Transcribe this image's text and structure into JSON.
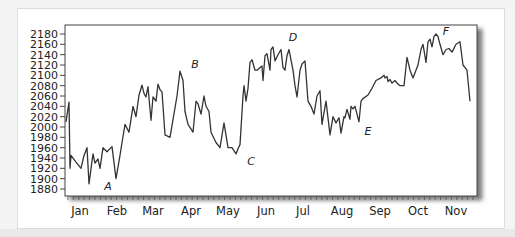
{
  "chart_data": {
    "type": "line",
    "title": "",
    "xlabel": "",
    "ylabel": "",
    "ylim": [
      1880,
      2180
    ],
    "grid": false,
    "legend": null,
    "y_ticks": [
      1880,
      1900,
      1920,
      1940,
      1960,
      1980,
      2000,
      2020,
      2040,
      2060,
      2080,
      2100,
      2120,
      2140,
      2160,
      2180
    ],
    "x_ticks": [
      "Jan",
      "Feb",
      "Mar",
      "Apr",
      "May",
      "Jun",
      "Jul",
      "Aug",
      "Sep",
      "Oct",
      "Nov"
    ],
    "annotations": [
      {
        "label": "A",
        "near_month": "Feb",
        "value": 1895,
        "position": "below trough"
      },
      {
        "label": "B",
        "near_month": "Apr",
        "value": 2110,
        "position": "above peak"
      },
      {
        "label": "C",
        "near_month": "May/Jun",
        "value": 1950,
        "position": "below trough"
      },
      {
        "label": "D",
        "near_month": "Jun/Jul",
        "value": 2155,
        "position": "above peak"
      },
      {
        "label": "E",
        "near_month": "Aug/Sep",
        "value": 2005,
        "position": "below trough"
      },
      {
        "label": "F",
        "near_month": "Oct/Nov",
        "value": 2180,
        "position": "above peak"
      }
    ],
    "series": [
      {
        "name": "Index",
        "x_px": [
          66,
          69,
          70,
          71,
          76,
          81,
          84,
          87,
          89,
          93,
          95,
          98,
          100,
          103,
          107,
          112,
          116,
          120,
          122,
          125,
          129,
          133,
          136,
          139,
          142,
          144,
          146,
          148,
          151,
          153,
          156,
          158,
          160,
          162,
          165,
          170,
          177,
          180,
          183,
          185,
          188,
          193,
          196,
          198,
          201,
          204,
          206,
          209,
          211,
          216,
          220,
          224,
          228,
          232,
          236,
          238,
          240,
          243,
          244,
          246,
          248,
          250,
          252,
          255,
          257,
          262,
          263,
          265,
          267,
          270,
          271,
          273,
          275,
          278,
          281,
          283,
          285,
          287,
          289,
          291,
          293,
          295,
          297,
          300,
          302,
          305,
          308,
          311,
          314,
          317,
          320,
          322,
          326,
          330,
          333,
          336,
          339,
          341,
          344,
          345,
          347,
          350,
          351,
          353,
          355,
          357,
          359,
          361,
          363,
          368,
          372,
          376,
          381,
          384,
          385,
          387,
          388,
          390,
          392,
          395,
          397,
          400,
          404,
          407,
          410,
          413,
          415,
          418,
          421,
          423,
          426,
          428,
          430,
          432,
          434,
          436,
          438,
          440,
          443,
          446,
          449,
          452,
          456,
          460,
          463,
          467,
          470,
          474
        ],
        "values": [
          2010,
          2048,
          1920,
          1945,
          1932,
          1920,
          1945,
          1960,
          1890,
          1948,
          1930,
          1938,
          1920,
          1960,
          1952,
          1962,
          1900,
          1945,
          1970,
          2005,
          1990,
          2040,
          2020,
          2062,
          2081,
          2065,
          2058,
          2078,
          2013,
          2058,
          2050,
          2083,
          2072,
          2068,
          1985,
          1980,
          2060,
          2108,
          2090,
          2030,
          2005,
          1990,
          2050,
          2045,
          2025,
          2060,
          2040,
          2030,
          1990,
          1970,
          1960,
          2008,
          1960,
          1960,
          1948,
          1958,
          1966,
          2060,
          2080,
          2050,
          2075,
          2125,
          2130,
          2110,
          2110,
          2118,
          2090,
          2138,
          2142,
          2110,
          2150,
          2155,
          2128,
          2140,
          2150,
          2115,
          2110,
          2138,
          2150,
          2130,
          2110,
          2080,
          2058,
          2110,
          2122,
          2128,
          2050,
          2040,
          2025,
          2060,
          2070,
          2005,
          2050,
          1985,
          2020,
          2008,
          2018,
          1988,
          2020,
          2018,
          2034,
          2015,
          2040,
          2035,
          2040,
          2025,
          2010,
          2050,
          2055,
          2062,
          2075,
          2090,
          2095,
          2100,
          2095,
          2098,
          2088,
          2092,
          2085,
          2090,
          2085,
          2080,
          2080,
          2135,
          2110,
          2095,
          2105,
          2120,
          2150,
          2160,
          2125,
          2165,
          2170,
          2155,
          2175,
          2180,
          2175,
          2160,
          2140,
          2150,
          2152,
          2145,
          2160,
          2165,
          2120,
          2110,
          2050
        ]
      }
    ]
  }
}
